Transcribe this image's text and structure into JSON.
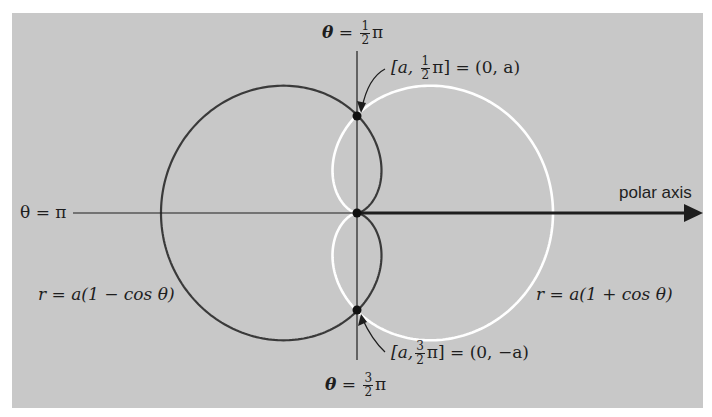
{
  "diagram": {
    "type": "polar-cardioids",
    "background_color": "#c8c8c8",
    "axis_color": "#1e1e1e",
    "curves": [
      {
        "id": "cardioid-minus",
        "equation": "r = a(1 − cos θ)",
        "color": "#3a3a3a",
        "side": "left"
      },
      {
        "id": "cardioid-plus",
        "equation": "r = a(1 + cos θ)",
        "color": "#ffffff",
        "side": "right"
      }
    ],
    "axis_labels": {
      "top": {
        "theta": "θ",
        "eq": "=",
        "num": "1",
        "den": "2",
        "pi": "π"
      },
      "bottom": {
        "theta": "θ",
        "eq": "=",
        "num": "3",
        "den": "2",
        "pi": "π"
      },
      "left": "θ = π",
      "right": "polar axis"
    },
    "annotations": {
      "upper_point": {
        "pre": "[a,",
        "num": "1",
        "den": "2",
        "post": "π] = (0, a)"
      },
      "lower_point": {
        "pre": "[a,",
        "num": "3",
        "den": "2",
        "post": "π] = (0, −a)"
      }
    },
    "equations": {
      "left": "r = a(1 − cos θ)",
      "right": "r = a(1 + cos θ)"
    },
    "geometry": {
      "origin_px": [
        357,
        213
      ],
      "a_px": 98
    }
  }
}
